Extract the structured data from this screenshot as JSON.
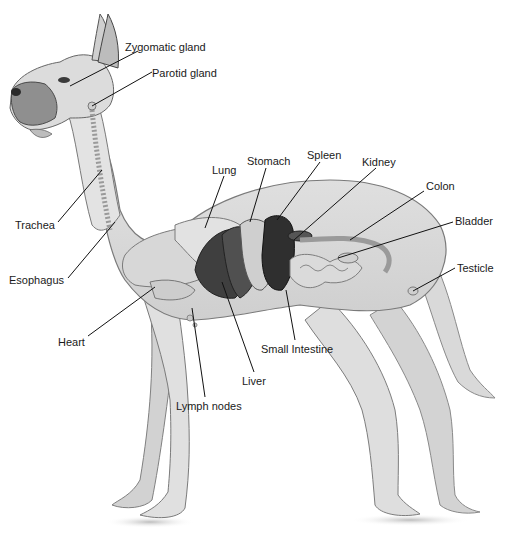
{
  "diagram": {
    "labels": [
      {
        "id": "zygomatic-gland",
        "text": "Zygomatic gland",
        "x": 125,
        "y": 41
      },
      {
        "id": "parotid-gland",
        "text": "Parotid gland",
        "x": 152,
        "y": 67
      },
      {
        "id": "lung",
        "text": "Lung",
        "x": 212,
        "y": 164
      },
      {
        "id": "stomach",
        "text": "Stomach",
        "x": 247,
        "y": 155
      },
      {
        "id": "spleen",
        "text": "Spleen",
        "x": 307,
        "y": 149
      },
      {
        "id": "kidney",
        "text": "Kidney",
        "x": 362,
        "y": 156
      },
      {
        "id": "colon",
        "text": "Colon",
        "x": 426,
        "y": 180
      },
      {
        "id": "bladder",
        "text": "Bladder",
        "x": 455,
        "y": 215
      },
      {
        "id": "testicle",
        "text": "Testicle",
        "x": 457,
        "y": 262
      },
      {
        "id": "trachea",
        "text": "Trachea",
        "x": 15,
        "y": 219
      },
      {
        "id": "esophagus",
        "text": "Esophagus",
        "x": 9,
        "y": 274
      },
      {
        "id": "heart",
        "text": "Heart",
        "x": 58,
        "y": 336
      },
      {
        "id": "small-intestine",
        "text": "Small Intestine",
        "x": 261,
        "y": 343
      },
      {
        "id": "liver",
        "text": "Liver",
        "x": 242,
        "y": 375
      },
      {
        "id": "lymph-nodes",
        "text": "Lymph nodes",
        "x": 176,
        "y": 400
      }
    ]
  }
}
